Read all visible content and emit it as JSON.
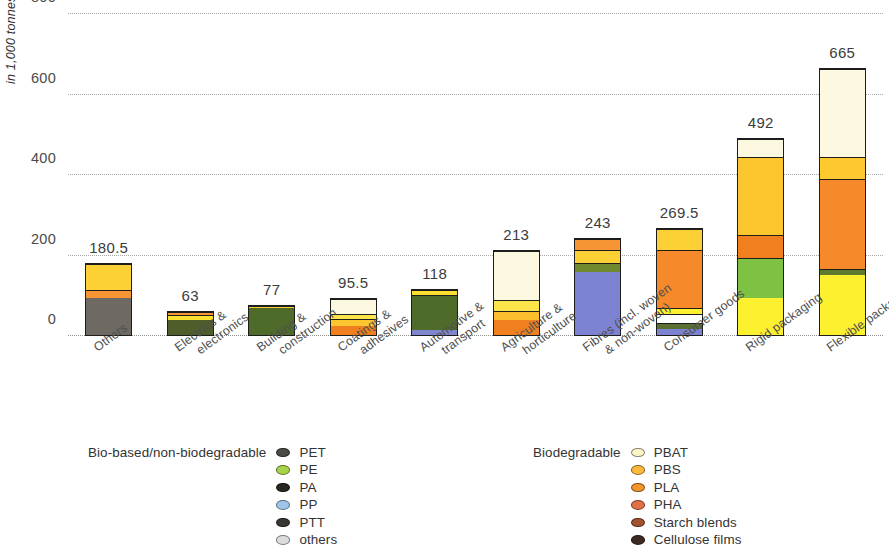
{
  "chart_data": {
    "type": "bar",
    "subtype": "stacked-bar",
    "title": "",
    "xlabel": "",
    "ylabel": "in 1,000 tonnes",
    "ylim": [
      0,
      800
    ],
    "yticks": [
      0,
      200,
      400,
      600,
      800
    ],
    "grid": "horizontal-dotted",
    "categories": [
      "Others",
      "Electrics & electronics",
      "Building & construction",
      "Coatings & adhesives",
      "Automotive & transport",
      "Agriculture & horticulture",
      "Fibres (incl. woven & non-woven)",
      "Consumer goods",
      "Rigid packaging",
      "Flexible packaging"
    ],
    "totals": [
      180.5,
      63,
      77,
      95.5,
      118,
      213,
      243,
      269.5,
      492,
      665
    ],
    "total_labels": [
      "180.5",
      "63",
      "77",
      "95.5",
      "118",
      "213",
      "243",
      "269.5",
      "492",
      "665"
    ],
    "series": [
      {
        "name": "PET",
        "color": "#3c3c3c",
        "values": [
          95,
          0,
          0,
          0,
          0,
          0,
          0,
          0,
          0,
          0
        ]
      },
      {
        "name": "PE",
        "color": "#8ec63f",
        "values": [
          0,
          40,
          72,
          0,
          0,
          0,
          26,
          14,
          100,
          12
        ]
      },
      {
        "name": "PA",
        "color": "#1d1d1d",
        "values": [
          0,
          0,
          0,
          0,
          0,
          0,
          8,
          0,
          0,
          0
        ]
      },
      {
        "name": "PP",
        "color": "#7b7fd4",
        "values": [
          0,
          0,
          0,
          0,
          12,
          0,
          160,
          16,
          0,
          0
        ]
      },
      {
        "name": "PTT",
        "color": "#2a2a2a",
        "values": [
          0,
          0,
          0,
          0,
          0,
          0,
          0,
          0,
          0,
          0
        ]
      },
      {
        "name": "others",
        "color": "#cfcfcf",
        "values": [
          0,
          0,
          0,
          0,
          0,
          0,
          0,
          0,
          0,
          0
        ]
      },
      {
        "name": "PBAT",
        "color": "#fdf6d8",
        "values": [
          0,
          0,
          0,
          42,
          0,
          92,
          0,
          0,
          38,
          250
        ]
      },
      {
        "name": "PBS",
        "color": "#fdc830",
        "values": [
          73,
          16,
          5,
          24,
          0,
          40,
          30,
          60,
          210,
          50
        ]
      },
      {
        "name": "PLA",
        "color": "#f6921e",
        "values": [
          12,
          7,
          0,
          29,
          0,
          63,
          19,
          155,
          60,
          230
        ]
      },
      {
        "name": "PHA",
        "color": "#e8703a",
        "values": [
          0,
          0,
          0,
          0,
          0,
          18,
          0,
          0,
          0,
          0
        ]
      },
      {
        "name": "Starch blends",
        "color": "#b5531f",
        "values": [
          0,
          0,
          0,
          0,
          0,
          0,
          0,
          0,
          0,
          0
        ]
      },
      {
        "name": "Cellulose films",
        "color": "#3b2a20",
        "values": [
          0,
          0,
          0,
          0,
          0,
          0,
          0,
          0,
          0,
          0
        ]
      },
      {
        "name": "others",
        "color": "#1a1a1a",
        "values": [
          0,
          0,
          0,
          0,
          0,
          0,
          0,
          0,
          0,
          0
        ]
      }
    ],
    "bars": [
      {
        "label": "Others",
        "total": 180.5,
        "value_text": "180.5",
        "segments": [
          {
            "name": "PET",
            "color": "#6e6a63",
            "value": 95
          },
          {
            "name": "PLA",
            "color": "#f79535",
            "value": 20
          },
          {
            "name": "PBS",
            "color": "#fdd035",
            "value": 65.5
          }
        ]
      },
      {
        "label": "Electrics & electronics",
        "total": 63,
        "value_text": "63",
        "segments": [
          {
            "name": "PE",
            "color": "#4e5d2a",
            "value": 40
          },
          {
            "name": "PBS",
            "color": "#fde02e",
            "value": 13
          },
          {
            "name": "PLA",
            "color": "#f79535",
            "value": 10
          }
        ]
      },
      {
        "label": "Building & construction",
        "total": 77,
        "value_text": "77",
        "segments": [
          {
            "name": "PE",
            "color": "#4e6b2a",
            "value": 72
          },
          {
            "name": "PBS",
            "color": "#fdd035",
            "value": 5
          }
        ]
      },
      {
        "label": "Coatings & adhesives",
        "total": 95.5,
        "value_text": "95.5",
        "segments": [
          {
            "name": "PLA",
            "color": "#f0801f",
            "value": 24
          },
          {
            "name": "PBS",
            "color": "#fdc62e",
            "value": 18
          },
          {
            "name": "PBS2",
            "color": "#fde44a",
            "value": 12
          },
          {
            "name": "PBAT",
            "color": "#fdf8e0",
            "value": 41.5
          }
        ]
      },
      {
        "label": "Automotive & transport",
        "total": 118,
        "value_text": "118",
        "segments": [
          {
            "name": "PP",
            "color": "#8085cf",
            "value": 14
          },
          {
            "name": "PE",
            "color": "#4e6b2a",
            "value": 90
          },
          {
            "name": "PBS",
            "color": "#fde02e",
            "value": 14
          }
        ]
      },
      {
        "label": "Agriculture & horticulture",
        "total": 213,
        "value_text": "213",
        "segments": [
          {
            "name": "PLA",
            "color": "#f0801f",
            "value": 38
          },
          {
            "name": "PBS",
            "color": "#fcbe2c",
            "value": 22
          },
          {
            "name": "PBS2",
            "color": "#fde44a",
            "value": 30
          },
          {
            "name": "PBAT",
            "color": "#fdf8e0",
            "value": 123
          }
        ]
      },
      {
        "label": "Fibres (incl. woven & non-woven)",
        "total": 243,
        "value_text": "243",
        "segments": [
          {
            "name": "PP",
            "color": "#7d82d2",
            "value": 160
          },
          {
            "name": "PE",
            "color": "#6f8a2e",
            "value": 22
          },
          {
            "name": "PBS",
            "color": "#fdd035",
            "value": 34
          },
          {
            "name": "PLA",
            "color": "#f79535",
            "value": 27
          }
        ]
      },
      {
        "label": "Consumer goods",
        "total": 269.5,
        "value_text": "269.5",
        "segments": [
          {
            "name": "PP",
            "color": "#7d82d2",
            "value": 14
          },
          {
            "name": "PE",
            "color": "#5b7030",
            "value": 16
          },
          {
            "name": "gap",
            "color": "#ffffff",
            "value": 22
          },
          {
            "name": "PBS2",
            "color": "#fdf02e",
            "value": 16
          },
          {
            "name": "PLA",
            "color": "#f68a2b",
            "value": 148
          },
          {
            "name": "PBS",
            "color": "#fdd035",
            "value": 53.5
          }
        ]
      },
      {
        "label": "Rigid packaging",
        "total": 492,
        "value_text": "492",
        "segments": [
          {
            "name": "PBS2",
            "color": "#fdf02e",
            "value": 92
          },
          {
            "name": "PE",
            "color": "#7dc242",
            "value": 102
          },
          {
            "name": "PLA",
            "color": "#f0801f",
            "value": 56
          },
          {
            "name": "PBS",
            "color": "#fdc62e",
            "value": 198
          },
          {
            "name": "PBAT",
            "color": "#fdf8e0",
            "value": 44
          }
        ]
      },
      {
        "label": "Flexible packaging",
        "total": 665,
        "value_text": "665",
        "segments": [
          {
            "name": "PBS2",
            "color": "#fdf02e",
            "value": 150
          },
          {
            "name": "PE",
            "color": "#5e7a2e",
            "value": 14
          },
          {
            "name": "PLA",
            "color": "#f68a2b",
            "value": 226
          },
          {
            "name": "PBS",
            "color": "#fcc92e",
            "value": 55
          },
          {
            "name": "PBAT",
            "color": "#fdf8e0",
            "value": 220
          }
        ]
      }
    ]
  },
  "axis": {
    "y_label": "in 1,000 tonnes",
    "y_ticks": [
      "800",
      "600",
      "400",
      "200",
      "0"
    ],
    "x_ticks": [
      {
        "line1": "Others",
        "line2": ""
      },
      {
        "line1": "Electrics &",
        "line2": "electronics"
      },
      {
        "line1": "Building &",
        "line2": "construction"
      },
      {
        "line1": "Coatings &",
        "line2": "adhesives"
      },
      {
        "line1": "Automotive &",
        "line2": "transport"
      },
      {
        "line1": "Agriculture &",
        "line2": "horticulture"
      },
      {
        "line1": "Fibres (incl. woven",
        "line2": "& non-woven)"
      },
      {
        "line1": "Consumer goods",
        "line2": ""
      },
      {
        "line1": "Rigid packaging",
        "line2": ""
      },
      {
        "line1": "Flexible packaging",
        "line2": ""
      }
    ]
  },
  "legend_left": {
    "title": "Bio-based/non-biodegradable",
    "items": [
      {
        "label": "PET",
        "color": "#4a4a46"
      },
      {
        "label": "PE",
        "color": "#a8d24a"
      },
      {
        "label": "PA",
        "color": "#2a2622"
      },
      {
        "label": "PP",
        "color": "#9fc6ea"
      },
      {
        "label": "PTT",
        "color": "#3a3632"
      },
      {
        "label": "others",
        "color": "#dcdcdc"
      }
    ]
  },
  "legend_right": {
    "title": "Biodegradable",
    "items": [
      {
        "label": "PBAT",
        "color": "#fbf5c8"
      },
      {
        "label": "PBS",
        "color": "#fbb83c"
      },
      {
        "label": "PLA",
        "color": "#f2952e"
      },
      {
        "label": "PHA",
        "color": "#e07046"
      },
      {
        "label": "Starch blends",
        "color": "#a2522c"
      },
      {
        "label": "Cellulose films",
        "color": "#3e2a22"
      },
      {
        "label": "others",
        "color": "#241c16"
      }
    ]
  }
}
